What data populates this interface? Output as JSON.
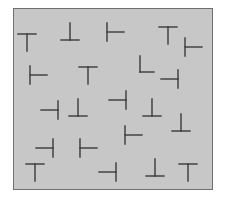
{
  "stimulus": {
    "description": "Visual search display of T and L shaped glyphs on a gray panel",
    "background_color": "#c7c7c7",
    "border_color": "#6f6f6f",
    "stroke_color": "#3a3a3a",
    "items": [
      {
        "shape": "T",
        "rotation": 0,
        "cx": 27,
        "cy": 42
      },
      {
        "shape": "T",
        "rotation": 180,
        "cx": 70,
        "cy": 32
      },
      {
        "shape": "T",
        "rotation": 270,
        "cx": 115,
        "cy": 32
      },
      {
        "shape": "T",
        "rotation": 0,
        "cx": 168,
        "cy": 35
      },
      {
        "shape": "T",
        "rotation": 270,
        "cx": 193,
        "cy": 47
      },
      {
        "shape": "T",
        "rotation": 270,
        "cx": 38,
        "cy": 75
      },
      {
        "shape": "T",
        "rotation": 0,
        "cx": 88,
        "cy": 75
      },
      {
        "shape": "L",
        "rotation": 0,
        "cx": 147,
        "cy": 65
      },
      {
        "shape": "T",
        "rotation": 90,
        "cx": 170,
        "cy": 79
      },
      {
        "shape": "T",
        "rotation": 90,
        "cx": 50,
        "cy": 110
      },
      {
        "shape": "T",
        "rotation": 180,
        "cx": 78,
        "cy": 108
      },
      {
        "shape": "T",
        "rotation": 90,
        "cx": 118,
        "cy": 100
      },
      {
        "shape": "T",
        "rotation": 180,
        "cx": 152,
        "cy": 108
      },
      {
        "shape": "T",
        "rotation": 180,
        "cx": 181,
        "cy": 123
      },
      {
        "shape": "T",
        "rotation": 270,
        "cx": 133,
        "cy": 135
      },
      {
        "shape": "T",
        "rotation": 90,
        "cx": 45,
        "cy": 148
      },
      {
        "shape": "T",
        "rotation": 270,
        "cx": 88,
        "cy": 148
      },
      {
        "shape": "T",
        "rotation": 0,
        "cx": 35,
        "cy": 172
      },
      {
        "shape": "T",
        "rotation": 90,
        "cx": 108,
        "cy": 172
      },
      {
        "shape": "T",
        "rotation": 180,
        "cx": 155,
        "cy": 168
      },
      {
        "shape": "T",
        "rotation": 0,
        "cx": 188,
        "cy": 172
      }
    ]
  }
}
